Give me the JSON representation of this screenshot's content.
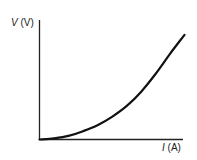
{
  "chart_data": {
    "type": "line",
    "title": "",
    "xlabel": "I (A)",
    "ylabel": "V (V)",
    "x_var": "I",
    "x_unit": "(A)",
    "y_var": "V",
    "y_unit": "(V)",
    "grid": false,
    "legend": null,
    "xlim": [
      0,
      1
    ],
    "ylim": [
      0,
      1
    ],
    "series": [
      {
        "name": "V vs I",
        "shape": "convex increasing curve from origin",
        "x": [
          0,
          0.1,
          0.2,
          0.3,
          0.4,
          0.5,
          0.6,
          0.7,
          0.8,
          0.9,
          1.0
        ],
        "values": [
          0,
          0.01,
          0.03,
          0.07,
          0.12,
          0.19,
          0.28,
          0.4,
          0.55,
          0.72,
          0.88
        ]
      }
    ],
    "colors": {
      "axis": "#222222",
      "curve": "#111111",
      "background": "#ffffff"
    }
  }
}
